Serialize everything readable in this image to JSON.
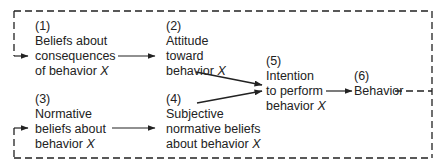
{
  "nodes": {
    "n1": {
      "num": "(1)",
      "lines": [
        "Beliefs about",
        "consequences",
        "of behavior"
      ],
      "var": "X"
    },
    "n2": {
      "num": "(2)",
      "lines": [
        "Attitude",
        "toward",
        "behavior"
      ],
      "var": "X"
    },
    "n3": {
      "num": "(3)",
      "lines": [
        "Normative",
        "beliefs about",
        "behavior"
      ],
      "var": "X"
    },
    "n4": {
      "num": "(4)",
      "lines": [
        "Subjective",
        "normative beliefs",
        "about behavior"
      ],
      "var": "X"
    },
    "n5": {
      "num": "(5)",
      "lines": [
        "Intention",
        "to perform",
        "behavior"
      ],
      "var": "X"
    },
    "n6": {
      "num": "(6)",
      "lines": [
        "Behavior"
      ]
    }
  },
  "edges": [
    {
      "from": "1",
      "to": "2",
      "style": "solid"
    },
    {
      "from": "3",
      "to": "4",
      "style": "solid"
    },
    {
      "from": "2",
      "to": "5",
      "style": "solid"
    },
    {
      "from": "4",
      "to": "5",
      "style": "solid"
    },
    {
      "from": "5",
      "to": "6",
      "style": "solid"
    },
    {
      "from": "6",
      "to": "1",
      "style": "dashed",
      "label": "feedback"
    },
    {
      "from": "6",
      "to": "3",
      "style": "dashed",
      "label": "feedback"
    }
  ],
  "colors": {
    "line": "#222222",
    "background": "#ffffff"
  }
}
